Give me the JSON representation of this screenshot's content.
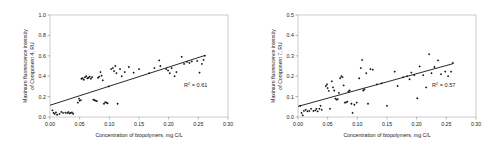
{
  "figure": {
    "background": "#ffffff",
    "panel_count": 2
  },
  "chart_data": [
    {
      "type": "scatter",
      "panel": "left",
      "title": "",
      "xlabel": "Concentration of biopolymers, mg C/L",
      "ylabel": "Maximum fluorescence intensity\nof Component 4, RU",
      "ylabel_line1": "Maximum fluorescence intensity",
      "ylabel_line2": "of Component 4, RU",
      "xlim": [
        0.0,
        0.3
      ],
      "ylim": [
        0.0,
        1.0
      ],
      "xticks": [
        0.0,
        0.05,
        0.1,
        0.15,
        0.2,
        0.25,
        0.3
      ],
      "xticklabels": [
        "0.00",
        "0.05",
        "0.10",
        "0.15",
        "0.20",
        "0.25",
        "0.30"
      ],
      "yticks": [
        0.0,
        0.2,
        0.4,
        0.6,
        0.8,
        1.0
      ],
      "yticklabels": [
        "0.0",
        "0.2",
        "0.4",
        "0.6",
        "0.8",
        "1.0"
      ],
      "grid": false,
      "legend": "none",
      "annotation": "R² = 0.61",
      "annotation_base": "R",
      "annotation_sup": "2",
      "annotation_rest": " = 0.61",
      "r_squared": 0.61,
      "marker": "diamond",
      "marker_color": "#151515",
      "trend_line": {
        "x": [
          0.0,
          0.262
        ],
        "y": [
          0.115,
          0.605
        ],
        "slope": 1.87,
        "intercept": 0.115,
        "color": "#101010"
      },
      "points": [
        [
          0.004,
          0.065
        ],
        [
          0.006,
          0.04
        ],
        [
          0.008,
          0.03
        ],
        [
          0.01,
          0.045
        ],
        [
          0.012,
          0.022
        ],
        [
          0.016,
          0.03
        ],
        [
          0.019,
          0.05
        ],
        [
          0.022,
          0.04
        ],
        [
          0.026,
          0.042
        ],
        [
          0.029,
          0.038
        ],
        [
          0.031,
          0.048
        ],
        [
          0.033,
          0.035
        ],
        [
          0.035,
          0.04
        ],
        [
          0.037,
          0.045
        ],
        [
          0.039,
          0.032
        ],
        [
          0.047,
          0.14
        ],
        [
          0.049,
          0.18
        ],
        [
          0.05,
          0.16
        ],
        [
          0.052,
          0.165
        ],
        [
          0.053,
          0.375
        ],
        [
          0.055,
          0.38
        ],
        [
          0.057,
          0.365
        ],
        [
          0.059,
          0.39
        ],
        [
          0.061,
          0.4
        ],
        [
          0.063,
          0.38
        ],
        [
          0.065,
          0.385
        ],
        [
          0.067,
          0.395
        ],
        [
          0.069,
          0.375
        ],
        [
          0.071,
          0.39
        ],
        [
          0.073,
          0.17
        ],
        [
          0.075,
          0.165
        ],
        [
          0.077,
          0.16
        ],
        [
          0.079,
          0.155
        ],
        [
          0.081,
          0.385
        ],
        [
          0.083,
          0.395
        ],
        [
          0.085,
          0.44
        ],
        [
          0.087,
          0.405
        ],
        [
          0.089,
          0.36
        ],
        [
          0.091,
          0.13
        ],
        [
          0.093,
          0.145
        ],
        [
          0.095,
          0.14
        ],
        [
          0.097,
          0.135
        ],
        [
          0.099,
          0.3
        ],
        [
          0.103,
          0.47
        ],
        [
          0.106,
          0.48
        ],
        [
          0.108,
          0.45
        ],
        [
          0.11,
          0.5
        ],
        [
          0.112,
          0.43
        ],
        [
          0.114,
          0.13
        ],
        [
          0.118,
          0.47
        ],
        [
          0.121,
          0.4
        ],
        [
          0.126,
          0.44
        ],
        [
          0.133,
          0.49
        ],
        [
          0.141,
          0.435
        ],
        [
          0.15,
          0.47
        ],
        [
          0.167,
          0.43
        ],
        [
          0.176,
          0.48
        ],
        [
          0.184,
          0.555
        ],
        [
          0.186,
          0.5
        ],
        [
          0.196,
          0.47
        ],
        [
          0.199,
          0.455
        ],
        [
          0.202,
          0.43
        ],
        [
          0.205,
          0.48
        ],
        [
          0.21,
          0.4
        ],
        [
          0.213,
          0.44
        ],
        [
          0.222,
          0.59
        ],
        [
          0.226,
          0.52
        ],
        [
          0.231,
          0.54
        ],
        [
          0.235,
          0.53
        ],
        [
          0.239,
          0.545
        ],
        [
          0.248,
          0.55
        ],
        [
          0.252,
          0.435
        ],
        [
          0.256,
          0.52
        ],
        [
          0.259,
          0.56
        ],
        [
          0.261,
          0.6
        ]
      ]
    },
    {
      "type": "scatter",
      "panel": "right",
      "title": "",
      "xlabel": "Concentration of biopolymers, mg C/L",
      "ylabel": "Maximum fluorescence intensity\nof Component 7, RU",
      "ylabel_line1": "Maximum fluorescence intensity",
      "ylabel_line2": "of Component 7, RU",
      "xlim": [
        0.0,
        0.3
      ],
      "ylim": [
        0.0,
        0.5
      ],
      "xticks": [
        0.0,
        0.05,
        0.1,
        0.15,
        0.2,
        0.25,
        0.3
      ],
      "xticklabels": [
        "0.00",
        "0.05",
        "0.10",
        "0.15",
        "0.20",
        "0.25",
        "0.30"
      ],
      "yticks": [
        0.0,
        0.1,
        0.2,
        0.3,
        0.4,
        0.5
      ],
      "yticklabels": [
        "0.0",
        "0.1",
        "0.2",
        "0.3",
        "0.4",
        "0.5"
      ],
      "grid": false,
      "legend": "none",
      "annotation": "R² = 0.57",
      "annotation_base": "R",
      "annotation_sup": "2",
      "annotation_rest": " = 0.57",
      "r_squared": 0.57,
      "marker": "diamond",
      "marker_color": "#151515",
      "trend_line": {
        "x": [
          0.0,
          0.262
        ],
        "y": [
          0.052,
          0.262
        ],
        "slope": 0.8,
        "intercept": 0.052,
        "color": "#101010"
      },
      "points": [
        [
          0.004,
          0.055
        ],
        [
          0.006,
          0.02
        ],
        [
          0.008,
          0.008
        ],
        [
          0.01,
          0.03
        ],
        [
          0.013,
          0.035
        ],
        [
          0.016,
          0.028
        ],
        [
          0.019,
          0.03
        ],
        [
          0.022,
          0.04
        ],
        [
          0.026,
          0.03
        ],
        [
          0.029,
          0.032
        ],
        [
          0.031,
          0.04
        ],
        [
          0.033,
          0.028
        ],
        [
          0.036,
          0.04
        ],
        [
          0.038,
          0.055
        ],
        [
          0.04,
          0.035
        ],
        [
          0.047,
          0.152
        ],
        [
          0.049,
          0.16
        ],
        [
          0.05,
          0.142
        ],
        [
          0.052,
          0.128
        ],
        [
          0.054,
          0.04
        ],
        [
          0.057,
          0.175
        ],
        [
          0.059,
          0.145
        ],
        [
          0.061,
          0.13
        ],
        [
          0.063,
          0.09
        ],
        [
          0.065,
          0.085
        ],
        [
          0.067,
          0.088
        ],
        [
          0.069,
          0.118
        ],
        [
          0.071,
          0.19
        ],
        [
          0.073,
          0.2
        ],
        [
          0.075,
          0.195
        ],
        [
          0.077,
          0.155
        ],
        [
          0.079,
          0.07
        ],
        [
          0.081,
          0.072
        ],
        [
          0.083,
          0.075
        ],
        [
          0.085,
          0.125
        ],
        [
          0.087,
          0.13
        ],
        [
          0.09,
          0.065
        ],
        [
          0.092,
          0.02
        ],
        [
          0.095,
          0.06
        ],
        [
          0.099,
          0.07
        ],
        [
          0.103,
          0.19
        ],
        [
          0.106,
          0.24
        ],
        [
          0.108,
          0.28
        ],
        [
          0.11,
          0.13
        ],
        [
          0.112,
          0.135
        ],
        [
          0.115,
          0.215
        ],
        [
          0.118,
          0.065
        ],
        [
          0.122,
          0.235
        ],
        [
          0.126,
          0.232
        ],
        [
          0.133,
          0.16
        ],
        [
          0.141,
          0.165
        ],
        [
          0.15,
          0.055
        ],
        [
          0.163,
          0.222
        ],
        [
          0.168,
          0.152
        ],
        [
          0.177,
          0.195
        ],
        [
          0.184,
          0.2
        ],
        [
          0.188,
          0.185
        ],
        [
          0.191,
          0.218
        ],
        [
          0.196,
          0.205
        ],
        [
          0.201,
          0.092
        ],
        [
          0.205,
          0.248
        ],
        [
          0.211,
          0.205
        ],
        [
          0.216,
          0.145
        ],
        [
          0.221,
          0.308
        ],
        [
          0.225,
          0.215
        ],
        [
          0.23,
          0.245
        ],
        [
          0.236,
          0.278
        ],
        [
          0.241,
          0.21
        ],
        [
          0.248,
          0.222
        ],
        [
          0.253,
          0.2
        ],
        [
          0.258,
          0.222
        ],
        [
          0.261,
          0.265
        ]
      ]
    }
  ]
}
